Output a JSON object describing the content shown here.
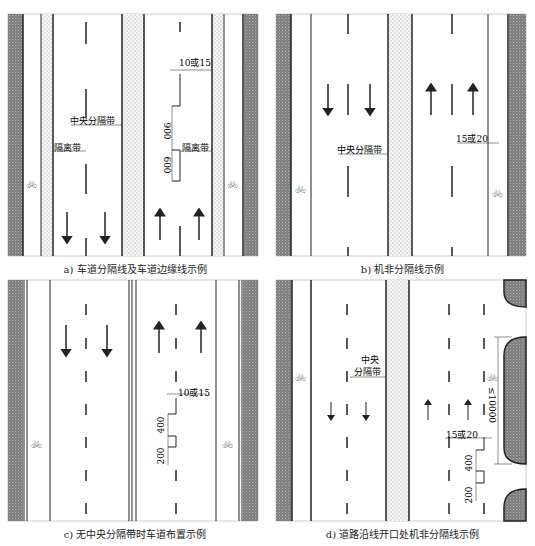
{
  "panels": {
    "a": {
      "caption": "a) 车道分隔线及车道边缘线示例",
      "labels": {
        "median": "中央分隔带",
        "separator_left": "隔离带",
        "separator_right": "隔离带",
        "width": "10或15",
        "dash_length": "600",
        "gap_length": "900"
      }
    },
    "b": {
      "caption": "b) 机非分隔线示例",
      "labels": {
        "median": "中央分隔带",
        "width": "15或20"
      }
    },
    "c": {
      "caption": "c) 无中央分隔带时车道布置示例",
      "labels": {
        "width": "10或15",
        "dash_length": "200",
        "gap_length": "400"
      }
    },
    "d": {
      "caption": "d) 道路沿线开口处机非分隔线示例",
      "labels": {
        "median_line1": "中央",
        "median_line2": "分隔带",
        "width": "15或20",
        "dash_length": "200",
        "gap_length": "400",
        "opening_length": "≤10000"
      }
    }
  },
  "colors": {
    "curb": "#8a8a8a",
    "line": "#222222",
    "median_fill": "#f2f2f2",
    "background": "#ffffff"
  },
  "icons": {
    "bicycle": "🚲"
  }
}
